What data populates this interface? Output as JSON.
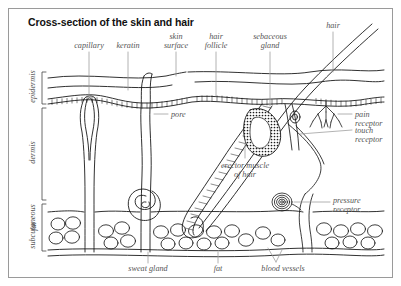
{
  "figure": {
    "title": "Cross-section of the skin and hair",
    "border_color": "#9a9a9a",
    "background": "#ffffff",
    "label_color": "#555555",
    "ink_color": "#1a1a1a"
  },
  "layer_labels": [
    {
      "name": "epidermis",
      "text": "epidermis"
    },
    {
      "name": "dermis",
      "text": "dermis"
    },
    {
      "name": "subcutaneous-fat-line1",
      "text": "subcutaneous"
    },
    {
      "name": "subcutaneous-fat-line2",
      "text": "fat"
    }
  ],
  "top_labels": [
    {
      "name": "capillary",
      "line1": "capillary",
      "line2": ""
    },
    {
      "name": "keratin",
      "line1": "keratin",
      "line2": ""
    },
    {
      "name": "skin-surface",
      "line1": "skin",
      "line2": "surface"
    },
    {
      "name": "hair-follicle",
      "line1": "hair",
      "line2": "follicle"
    },
    {
      "name": "sebaceous-gland",
      "line1": "sebaceous",
      "line2": "gland"
    },
    {
      "name": "hair",
      "line1": "hair",
      "line2": ""
    }
  ],
  "interior_labels": [
    {
      "name": "pore",
      "line1": "pore",
      "line2": ""
    },
    {
      "name": "erector-muscle-of-hair",
      "line1": "erector muscle",
      "line2": "of hair"
    }
  ],
  "right_labels": [
    {
      "name": "pain-receptor",
      "line1": "pain",
      "line2": "receptor"
    },
    {
      "name": "touch-receptor",
      "line1": "touch",
      "line2": "receptor"
    },
    {
      "name": "pressure-receptor",
      "line1": "pressure",
      "line2": "receptor"
    }
  ],
  "bottom_labels": [
    {
      "name": "sweat-gland",
      "text": "sweat gland"
    },
    {
      "name": "fat",
      "text": "fat"
    },
    {
      "name": "blood-vessels",
      "text": "blood vessels"
    }
  ]
}
